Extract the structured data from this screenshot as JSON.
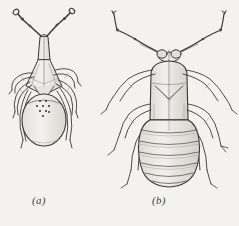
{
  "plate": {
    "background_color": "#f4f2ef",
    "ink_color": "#3a3a3a",
    "fill_color": "#eceae6",
    "width": 239,
    "height": 226,
    "medium": "pen-and-ink scientific line drawing",
    "subject": "two dorsal-view insect illustrations"
  },
  "figures": [
    {
      "id": "a",
      "caption": "(a)",
      "name": "small-bug-dorsal-view",
      "description": "Dorsal view of a small bug with long slender clubbed antennae, narrow triangular head and pronotum, six legs, and a rounded oval abdomen bearing a cluster of small dark spots",
      "parts": {
        "antennae_count": 2,
        "antenna_segments": 4,
        "legs_count": 6,
        "abdomen_shape": "broad oval",
        "abdomen_spots": 9
      }
    },
    {
      "id": "b",
      "caption": "(b)",
      "name": "large-bug-nymph-dorsal-view",
      "description": "Dorsal view of a larger bug nymph with long angled antennae, two prominent compound eyes, a large rectangular pronotum with a V-shaped median suture, six long legs, and a broad segmented abdomen",
      "parts": {
        "antennae_count": 2,
        "antenna_segments": 4,
        "eyes_count": 2,
        "legs_count": 6,
        "abdomen_shape": "broad rounded",
        "abdomen_segments": 7
      }
    }
  ]
}
